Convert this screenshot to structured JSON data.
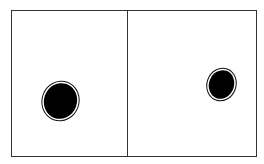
{
  "diagram": {
    "panels": [
      {
        "name": "left-panel",
        "blob": {
          "shape": "ellipse",
          "fill": "#000000",
          "outline": "double"
        }
      },
      {
        "name": "right-panel",
        "blob": {
          "shape": "ellipse",
          "fill": "#000000",
          "outline": "double"
        }
      }
    ],
    "colors": {
      "border": "#333333",
      "background": "#ffffff",
      "blob": "#000000"
    }
  }
}
